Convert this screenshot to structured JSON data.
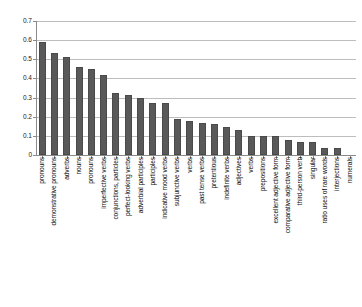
{
  "chart_data": {
    "type": "bar",
    "title": "",
    "subtitle": "",
    "xlabel": "",
    "ylabel": "",
    "ylim": [
      0,
      0.7
    ],
    "yticks": [
      "0",
      "0.1",
      "0.2",
      "0.3",
      "0.4",
      "0.5",
      "0.6",
      "0.7"
    ],
    "ytick_values": [
      0,
      0.1,
      0.2,
      0.3,
      0.4,
      0.5,
      0.6,
      0.7
    ],
    "grid": true,
    "legend": "none",
    "bar_color": "#595959",
    "categories": [
      "pronouns",
      "demonstrative pronouns",
      "adverbs",
      "nouns",
      "pronouns",
      "imperfective verbs",
      "conjunctions, particles",
      "perfect-looking verbs",
      "adverbial participles",
      "participles",
      "indicative mood verbs",
      "subjunctive verbs",
      "verbs",
      "past tense verbs",
      "pretentious",
      "indefinite verbs",
      "adjectives",
      "verbs",
      "prepositions",
      "excellent adjective form",
      "comparative adjective form",
      "third-person verb",
      "singular",
      "ratio uses of rare words",
      "interjections",
      "numerals"
    ],
    "values": [
      0.59,
      0.535,
      0.51,
      0.46,
      0.45,
      0.42,
      0.325,
      0.315,
      0.3,
      0.27,
      0.27,
      0.19,
      0.18,
      0.165,
      0.163,
      0.145,
      0.13,
      0.1,
      0.1,
      0.098,
      0.078,
      0.068,
      0.066,
      0.035,
      0.035,
      0.0
    ]
  }
}
